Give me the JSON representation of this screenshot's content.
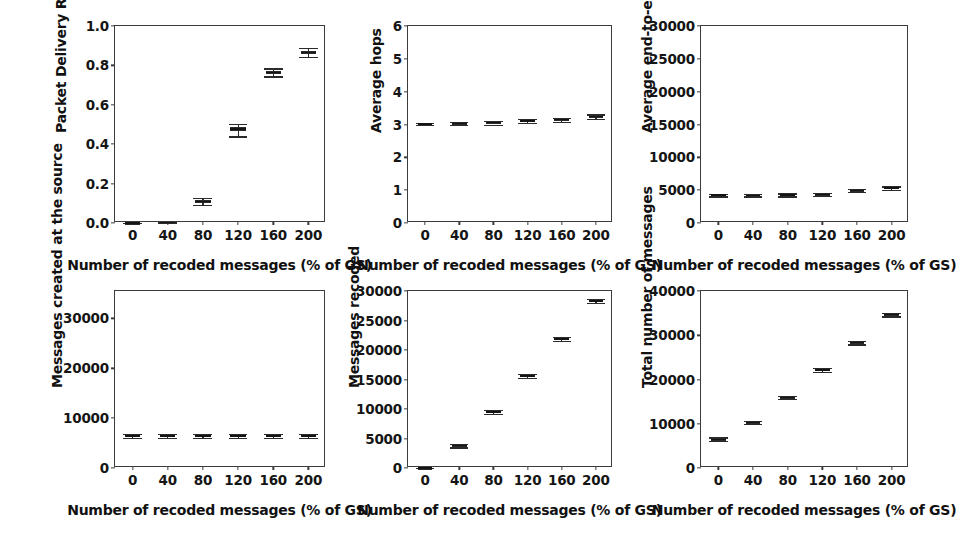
{
  "figure": {
    "background": "#ffffff",
    "layout": "2 rows x 3 columns of box-plot subplots",
    "shared_xlabel": "Number of recoded messages (% of GS)",
    "shared_categories": [
      "0",
      "40",
      "80",
      "120",
      "160",
      "200"
    ]
  },
  "chart_data": [
    {
      "type": "box",
      "id": "packet-delivery-ratio",
      "title": "",
      "xlabel": "Number of recoded messages (% of GS)",
      "ylabel": "Packet Delivery Ratio",
      "categories": [
        "0",
        "40",
        "80",
        "120",
        "160",
        "200"
      ],
      "xlim": [
        -20,
        220
      ],
      "ylim": [
        0.0,
        1.0
      ],
      "yticks": [
        0.0,
        0.2,
        0.4,
        0.6,
        0.8,
        1.0
      ],
      "yticklabels": [
        "0.0",
        "0.2",
        "0.4",
        "0.6",
        "0.8",
        "1.0"
      ],
      "xticks": [
        0,
        40,
        80,
        120,
        160,
        200
      ],
      "grid": false,
      "boxes": [
        {
          "x": 0,
          "whisker_low": 0.0,
          "q1": 0.0,
          "median": 0.0,
          "q3": 0.0,
          "whisker_high": 0.0
        },
        {
          "x": 40,
          "whisker_low": 0.001,
          "q1": 0.002,
          "median": 0.003,
          "q3": 0.004,
          "whisker_high": 0.005
        },
        {
          "x": 80,
          "whisker_low": 0.093,
          "q1": 0.103,
          "median": 0.108,
          "q3": 0.115,
          "whisker_high": 0.126
        },
        {
          "x": 120,
          "whisker_low": 0.44,
          "q1": 0.466,
          "median": 0.477,
          "q3": 0.486,
          "whisker_high": 0.501
        },
        {
          "x": 160,
          "whisker_low": 0.744,
          "q1": 0.757,
          "median": 0.764,
          "q3": 0.773,
          "whisker_high": 0.785
        },
        {
          "x": 200,
          "whisker_low": 0.845,
          "q1": 0.858,
          "median": 0.866,
          "q3": 0.874,
          "whisker_high": 0.887
        }
      ]
    },
    {
      "type": "box",
      "id": "average-hops",
      "title": "",
      "xlabel": "Number of recoded messages (% of GS)",
      "ylabel": "Average hops",
      "categories": [
        "0",
        "40",
        "80",
        "120",
        "160",
        "200"
      ],
      "xlim": [
        -20,
        220
      ],
      "ylim": [
        0,
        6
      ],
      "yticks": [
        0,
        1,
        2,
        3,
        4,
        5,
        6
      ],
      "yticklabels": [
        "0",
        "1",
        "2",
        "3",
        "4",
        "5",
        "6"
      ],
      "xticks": [
        0,
        40,
        80,
        120,
        160,
        200
      ],
      "grid": false,
      "boxes": [
        {
          "x": 0,
          "whisker_low": 3.0,
          "q1": 3.01,
          "median": 3.02,
          "q3": 3.03,
          "whisker_high": 3.05
        },
        {
          "x": 40,
          "whisker_low": 2.99,
          "q1": 3.01,
          "median": 3.03,
          "q3": 3.05,
          "whisker_high": 3.07
        },
        {
          "x": 80,
          "whisker_low": 3.0,
          "q1": 3.04,
          "median": 3.06,
          "q3": 3.08,
          "whisker_high": 3.12
        },
        {
          "x": 120,
          "whisker_low": 3.04,
          "q1": 3.08,
          "median": 3.11,
          "q3": 3.13,
          "whisker_high": 3.17
        },
        {
          "x": 160,
          "whisker_low": 3.08,
          "q1": 3.12,
          "median": 3.15,
          "q3": 3.17,
          "whisker_high": 3.21
        },
        {
          "x": 200,
          "whisker_low": 3.18,
          "q1": 3.22,
          "median": 3.25,
          "q3": 3.27,
          "whisker_high": 3.31
        }
      ]
    },
    {
      "type": "box",
      "id": "average-end-to-end-delay",
      "title": "",
      "xlabel": "Number of recoded messages (% of GS)",
      "ylabel": "Average end-to-end Delay (s)",
      "categories": [
        "0",
        "40",
        "80",
        "120",
        "160",
        "200"
      ],
      "xlim": [
        -20,
        220
      ],
      "ylim": [
        0,
        30000
      ],
      "yticks": [
        0,
        5000,
        10000,
        15000,
        20000,
        25000,
        30000
      ],
      "yticklabels": [
        "0",
        "5000",
        "10000",
        "15000",
        "20000",
        "25000",
        "30000"
      ],
      "xticks": [
        0,
        40,
        80,
        120,
        160,
        200
      ],
      "grid": false,
      "boxes": [
        {
          "x": 0,
          "whisker_low": 4050,
          "q1": 4180,
          "median": 4250,
          "q3": 4320,
          "whisker_high": 4450
        },
        {
          "x": 40,
          "whisker_low": 4050,
          "q1": 4160,
          "median": 4230,
          "q3": 4300,
          "whisker_high": 4420
        },
        {
          "x": 80,
          "whisker_low": 4060,
          "q1": 4200,
          "median": 4280,
          "q3": 4360,
          "whisker_high": 4520
        },
        {
          "x": 120,
          "whisker_low": 4150,
          "q1": 4300,
          "median": 4380,
          "q3": 4460,
          "whisker_high": 4600
        },
        {
          "x": 160,
          "whisker_low": 4680,
          "q1": 4850,
          "median": 4950,
          "q3": 5040,
          "whisker_high": 5200
        },
        {
          "x": 200,
          "whisker_low": 5050,
          "q1": 5220,
          "median": 5320,
          "q3": 5410,
          "whisker_high": 5580
        }
      ]
    },
    {
      "type": "box",
      "id": "messages-created-at-the-source",
      "title": "",
      "xlabel": "Number of recoded messages (% of GS)",
      "ylabel": "Messages created at the source",
      "categories": [
        "0",
        "40",
        "80",
        "120",
        "160",
        "200"
      ],
      "xlim": [
        -20,
        220
      ],
      "ylim": [
        0,
        35500
      ],
      "yticks": [
        0,
        10000,
        20000,
        30000
      ],
      "yticklabels": [
        "0",
        "10000",
        "20000",
        "30000"
      ],
      "xticks": [
        0,
        40,
        80,
        120,
        160,
        200
      ],
      "grid": false,
      "boxes": [
        {
          "x": 0,
          "whisker_low": 6050,
          "q1": 6300,
          "median": 6450,
          "q3": 6580,
          "whisker_high": 6820
        },
        {
          "x": 40,
          "whisker_low": 6060,
          "q1": 6310,
          "median": 6450,
          "q3": 6590,
          "whisker_high": 6830
        },
        {
          "x": 80,
          "whisker_low": 6050,
          "q1": 6300,
          "median": 6440,
          "q3": 6580,
          "whisker_high": 6810
        },
        {
          "x": 120,
          "whisker_low": 6060,
          "q1": 6310,
          "median": 6450,
          "q3": 6590,
          "whisker_high": 6830
        },
        {
          "x": 160,
          "whisker_low": 6050,
          "q1": 6300,
          "median": 6450,
          "q3": 6580,
          "whisker_high": 6820
        },
        {
          "x": 200,
          "whisker_low": 6060,
          "q1": 6310,
          "median": 6450,
          "q3": 6590,
          "whisker_high": 6830
        }
      ]
    },
    {
      "type": "box",
      "id": "messages-recoded",
      "title": "",
      "xlabel": "Number of recoded messages (% of GS)",
      "ylabel": "Messages recoded",
      "categories": [
        "0",
        "40",
        "80",
        "120",
        "160",
        "200"
      ],
      "xlim": [
        -20,
        220
      ],
      "ylim": [
        0,
        30000
      ],
      "yticks": [
        0,
        5000,
        10000,
        15000,
        20000,
        25000,
        30000
      ],
      "yticklabels": [
        "0",
        "5000",
        "10000",
        "15000",
        "20000",
        "25000",
        "30000"
      ],
      "xticks": [
        0,
        40,
        80,
        120,
        160,
        200
      ],
      "grid": false,
      "boxes": [
        {
          "x": 0,
          "whisker_low": 0,
          "q1": 0,
          "median": 0,
          "q3": 0,
          "whisker_high": 0
        },
        {
          "x": 40,
          "whisker_low": 3500,
          "q1": 3700,
          "median": 3800,
          "q3": 3900,
          "whisker_high": 4100
        },
        {
          "x": 80,
          "whisker_low": 9180,
          "q1": 9380,
          "median": 9480,
          "q3": 9580,
          "whisker_high": 9780
        },
        {
          "x": 120,
          "whisker_low": 15280,
          "q1": 15500,
          "median": 15620,
          "q3": 15740,
          "whisker_high": 15960
        },
        {
          "x": 160,
          "whisker_low": 21500,
          "q1": 21720,
          "median": 21850,
          "q3": 21980,
          "whisker_high": 22200
        },
        {
          "x": 200,
          "whisker_low": 27950,
          "q1": 28180,
          "median": 28320,
          "q3": 28450,
          "whisker_high": 28700
        }
      ]
    },
    {
      "type": "box",
      "id": "total-number-of-messages",
      "title": "",
      "xlabel": "Number of recoded messages (% of GS)",
      "ylabel": "Total number of messages",
      "categories": [
        "0",
        "40",
        "80",
        "120",
        "160",
        "200"
      ],
      "xlim": [
        -20,
        220
      ],
      "ylim": [
        0,
        40000
      ],
      "yticks": [
        0,
        10000,
        20000,
        30000,
        40000
      ],
      "yticklabels": [
        "0",
        "10000",
        "20000",
        "30000",
        "40000"
      ],
      "xticks": [
        0,
        40,
        80,
        120,
        160,
        200
      ],
      "grid": false,
      "boxes": [
        {
          "x": 0,
          "whisker_low": 6100,
          "q1": 6350,
          "median": 6500,
          "q3": 6650,
          "whisker_high": 6900
        },
        {
          "x": 40,
          "whisker_low": 9900,
          "q1": 10150,
          "median": 10300,
          "q3": 10450,
          "whisker_high": 10700
        },
        {
          "x": 80,
          "whisker_low": 15550,
          "q1": 15800,
          "median": 15950,
          "q3": 16100,
          "whisker_high": 16350
        },
        {
          "x": 120,
          "whisker_low": 21750,
          "q1": 22000,
          "median": 22150,
          "q3": 22300,
          "whisker_high": 22560
        },
        {
          "x": 160,
          "whisker_low": 27950,
          "q1": 28200,
          "median": 28350,
          "q3": 28500,
          "whisker_high": 28760
        },
        {
          "x": 200,
          "whisker_low": 34250,
          "q1": 34500,
          "median": 34650,
          "q3": 34800,
          "whisker_high": 35050
        }
      ]
    }
  ]
}
